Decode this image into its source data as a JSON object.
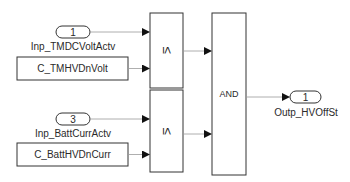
{
  "diagram": {
    "type": "simulink-block-diagram",
    "inports": [
      {
        "id": "inport-1",
        "number": "1",
        "label": "Inp_TMDCVoltActv"
      },
      {
        "id": "inport-3",
        "number": "3",
        "label": "Inp_BattCurrActv"
      }
    ],
    "constants": [
      {
        "id": "const-1",
        "label": "C_TMHVDnVolt"
      },
      {
        "id": "const-2",
        "label": "C_BattHVDnCurr"
      }
    ],
    "compare_blocks": [
      {
        "id": "cmp-1",
        "operator": "≤"
      },
      {
        "id": "cmp-2",
        "operator": "≤"
      }
    ],
    "logic_block": {
      "id": "and-1",
      "operator": "AND"
    },
    "outport": {
      "id": "outport-1",
      "number": "1",
      "label": "Outp_HVOffSt"
    },
    "colors": {
      "line": "#333333",
      "signal": "#9a9a9a",
      "background": "#ffffff"
    }
  }
}
